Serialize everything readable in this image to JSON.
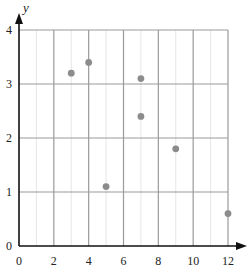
{
  "chart_data": {
    "type": "scatter",
    "title": "",
    "xlabel": "",
    "ylabel": "y",
    "xlim": [
      0,
      12
    ],
    "ylim": [
      0,
      4
    ],
    "x_ticks": [
      0,
      2,
      4,
      6,
      8,
      10,
      12
    ],
    "y_ticks": [
      0,
      1,
      2,
      3,
      4
    ],
    "grid": true,
    "minor_grid_x": [
      1,
      3,
      5,
      7,
      9,
      11
    ],
    "legend": null,
    "series": [
      {
        "name": "points",
        "color": "#8c8c8c",
        "points": [
          {
            "x": 3,
            "y": 3.2
          },
          {
            "x": 4,
            "y": 3.4
          },
          {
            "x": 5,
            "y": 1.1
          },
          {
            "x": 7,
            "y": 3.1
          },
          {
            "x": 7,
            "y": 2.4
          },
          {
            "x": 9,
            "y": 1.8
          },
          {
            "x": 12,
            "y": 0.6
          }
        ]
      }
    ]
  },
  "colors": {
    "axis": "#111111",
    "major_grid": "#9a9a9a",
    "minor_grid": "#e6e6e6",
    "point": "#8c8c8c"
  }
}
